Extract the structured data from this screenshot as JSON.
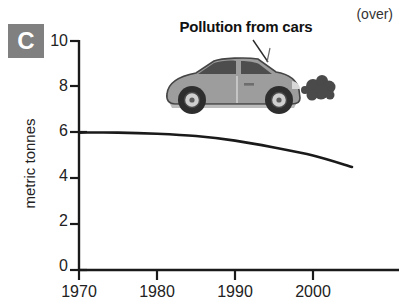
{
  "panel": {
    "letter": "C"
  },
  "note": {
    "over_label": "(over)"
  },
  "chart_data": {
    "type": "line",
    "title": "Pollution from cars",
    "xlabel": "",
    "ylabel": "metric tonnes",
    "xlim": [
      1970,
      2005
    ],
    "ylim": [
      0,
      10
    ],
    "xticks": [
      1970,
      1980,
      1990,
      2000
    ],
    "xtick_labels": [
      "1970",
      "1980",
      "1990",
      "2000"
    ],
    "yticks": [
      0,
      2,
      4,
      6,
      8,
      10
    ],
    "ytick_labels": [
      "0",
      "2",
      "4",
      "6",
      "8",
      "10"
    ],
    "grid": false,
    "legend": null,
    "series": [
      {
        "name": "Pollution from cars",
        "color": "#1a1a1a",
        "x": [
          1970,
          1975,
          1980,
          1985,
          1990,
          1995,
          2000,
          2005
        ],
        "values": [
          6.0,
          6.0,
          5.95,
          5.85,
          5.65,
          5.35,
          5.0,
          4.5
        ]
      }
    ],
    "annotations": [
      {
        "name": "car-illustration",
        "label": "grey hatchback car emitting exhaust smoke"
      },
      {
        "name": "title-pointer",
        "label": "leader line from title to car"
      }
    ]
  },
  "colors": {
    "badge_background": "#808080",
    "badge_text": "#ffffff",
    "axis": "#1a1a1a",
    "line": "#1a1a1a",
    "car_body": "#9a9a9a",
    "car_dark": "#3a3a3a",
    "smoke": "#4a4a4a"
  }
}
